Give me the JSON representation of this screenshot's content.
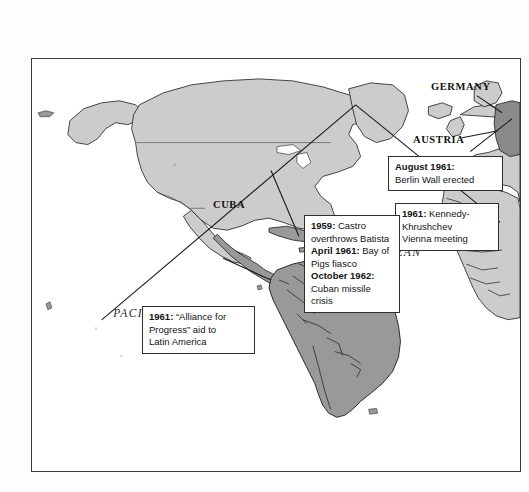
{
  "map": {
    "title": "Cold War in the Americas and Europe",
    "frame": {
      "border_color": "#3a3a3a",
      "background": "#ffffff"
    },
    "colors": {
      "land_light": "#cccccc",
      "land_dark": "#999999",
      "land_darker": "#8a8a8a",
      "coastline": "#1a1a1a",
      "ocean": "#ffffff",
      "callout_border": "#2e2e2e",
      "leader_line": "#1a1a1a"
    },
    "ocean_labels": [
      {
        "id": "atlantic",
        "name": "ATLANTIC OCEAN",
        "line1": "ATLANTIC",
        "line2": "OCEAN"
      },
      {
        "id": "pacific",
        "name": "PACIFIC OCEAN",
        "line1": "PACIFIC   OCEAN",
        "line2": ""
      }
    ],
    "country_labels": [
      {
        "id": "cuba",
        "text": "CUBA"
      },
      {
        "id": "germany",
        "text": "GERMANY"
      },
      {
        "id": "austria",
        "text": "AUSTRIA"
      }
    ]
  },
  "callouts": [
    {
      "id": "berlin",
      "lines": [
        {
          "bold": "August 1961:",
          "rest": ""
        },
        {
          "bold": "",
          "rest": "Berlin Wall erected"
        }
      ],
      "full_text": "August 1961: Berlin Wall erected"
    },
    {
      "id": "vienna",
      "lines": [
        {
          "bold": "1961:",
          "rest": " Kennedy-"
        },
        {
          "bold": "",
          "rest": "Khrushchev"
        },
        {
          "bold": "",
          "rest": "Vienna meeting"
        }
      ],
      "full_text": "1961: Kennedy-Khrushchev Vienna meeting"
    },
    {
      "id": "cuba",
      "lines": [
        {
          "bold": "1959:",
          "rest": " Castro"
        },
        {
          "bold": "",
          "rest": "overthrows Batista"
        },
        {
          "bold": "April 1961:",
          "rest": " Bay of"
        },
        {
          "bold": "",
          "rest": "Pigs fiasco"
        },
        {
          "bold": "October 1962:",
          "rest": ""
        },
        {
          "bold": "",
          "rest": "Cuban missile crisis"
        }
      ],
      "full_text": "1959: Castro overthrows Batista. April 1961: Bay of Pigs fiasco. October 1962: Cuban missile crisis"
    },
    {
      "id": "alliance",
      "lines": [
        {
          "bold": "1961:",
          "rest": " “Alliance for"
        },
        {
          "bold": "",
          "rest": "Progress” aid to"
        },
        {
          "bold": "",
          "rest": "Latin America"
        }
      ],
      "full_text": "1961: “Alliance for Progress” aid to Latin America"
    }
  ]
}
